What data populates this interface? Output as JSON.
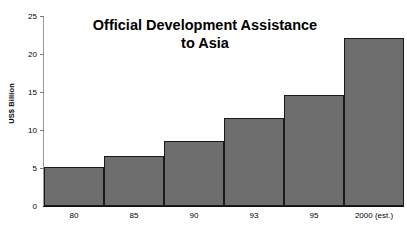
{
  "chart_data": {
    "type": "bar",
    "title": "Official Development Assistance to Asia",
    "title_line1": "Official Development Assistance",
    "title_line2": "to Asia",
    "xlabel": "",
    "ylabel": "US$ Billion",
    "categories": [
      "80",
      "85",
      "90",
      "93",
      "95",
      "2000 (est.)"
    ],
    "values": [
      5.1,
      6.6,
      8.6,
      11.6,
      14.6,
      22.1
    ],
    "ylim": [
      0,
      25
    ],
    "yticks": [
      0,
      5,
      10,
      15,
      20,
      25
    ],
    "ytick_labels": [
      "0",
      "5",
      "10",
      "15",
      "20",
      "25"
    ],
    "grid": false,
    "legend": false,
    "bar_color": "#6e6e6e",
    "bar_border_color": "#1a1a1a",
    "background_color": "#ffffff",
    "axis_color": "#111111",
    "bar_gap": 0
  }
}
